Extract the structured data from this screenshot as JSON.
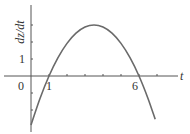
{
  "chart_data": {
    "type": "line",
    "title": "",
    "xlabel": "t",
    "ylabel": "dz/dt",
    "xlim": [
      -1.2,
      8
    ],
    "ylim": [
      -3.0,
      4.2
    ],
    "x_ticks": [
      1,
      2,
      3,
      4,
      5,
      6,
      7
    ],
    "y_ticks": [
      -2,
      -1,
      1,
      2,
      3
    ],
    "x_tick_labels": [
      {
        "value": 1,
        "label": "1"
      },
      {
        "value": 6,
        "label": "6"
      }
    ],
    "y_tick_labels": [
      {
        "value": 1,
        "label": "1"
      }
    ],
    "origin_label": "0",
    "grid": false,
    "series": [
      {
        "name": "dz/dt",
        "description": "downward parabola with roots at t=1 and t=6, max 3 at t=3.5",
        "x": [
          0,
          0.5,
          1,
          1.5,
          2,
          2.5,
          3,
          3.5,
          4,
          4.5,
          5,
          5.5,
          6,
          6.5,
          6.9
        ],
        "y": [
          -2.88,
          -1.32,
          0,
          1.08,
          1.92,
          2.52,
          2.88,
          3.0,
          2.88,
          2.52,
          1.92,
          1.08,
          0,
          -1.32,
          -2.55
        ]
      }
    ]
  }
}
